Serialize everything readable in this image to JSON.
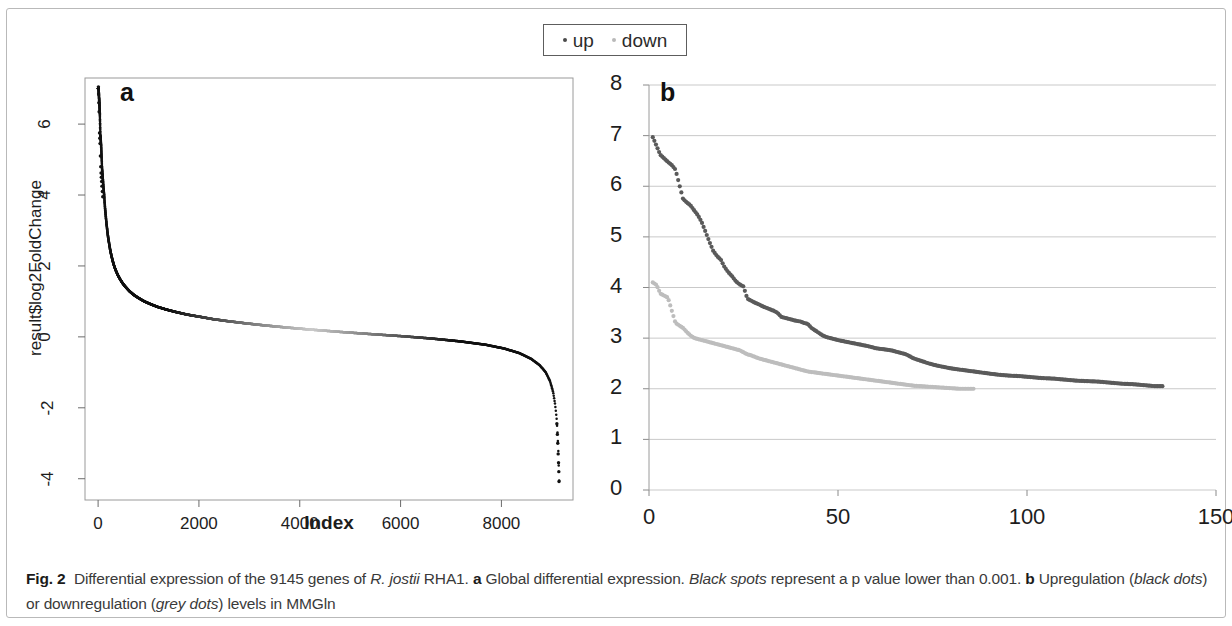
{
  "figure": {
    "frame_color": "#b9b9b9",
    "background": "#ffffff"
  },
  "legend": {
    "entries": [
      {
        "label": "up",
        "color": "#4a4a4a",
        "marker": "dot-marker"
      },
      {
        "label": "down",
        "color": "#b9b9b9",
        "marker": "dot-marker"
      }
    ]
  },
  "caption": {
    "fig_label": "Fig. 2",
    "text_1": "Differential expression of the 9145 genes of ",
    "italic_1": "R. jostii",
    "text_2": " RHA1. ",
    "bold_a": "a",
    "text_3": " Global differential expression. ",
    "italic_2": "Black spots",
    "text_4": " represent a p value lower than 0.001. ",
    "bold_b": "b",
    "text_5": " Upregulation (",
    "italic_3": "black dots",
    "text_6": ") or downregulation (",
    "italic_4": "grey dots",
    "text_7": ") levels in MMGln"
  },
  "chart_data": [
    {
      "id": "panel-a",
      "type": "scatter",
      "panel_letter": "a",
      "title": "Global differential expression",
      "xlabel": "Index",
      "ylabel": "result$log2FoldChange",
      "xlim": [
        -260,
        9420
      ],
      "ylim": [
        -4.6,
        7.3
      ],
      "xticks": [
        0,
        2000,
        4000,
        6000,
        8000
      ],
      "yticks": [
        -4,
        -2,
        0,
        2,
        4,
        6
      ],
      "grid": false,
      "frame": true,
      "n_genes": 9145,
      "significant_color": "#111111",
      "nonsignificant_color": "#b0b0b0",
      "description": "Sorted log2 fold change of all 9145 genes; significant (p < 0.001) points black, non-significant grey",
      "points": [
        [
          10,
          7.0
        ],
        [
          18,
          6.75
        ],
        [
          26,
          6.55
        ],
        [
          34,
          6.3
        ],
        [
          44,
          5.7
        ],
        [
          52,
          5.55
        ],
        [
          60,
          5.4
        ],
        [
          70,
          5.05
        ],
        [
          78,
          4.75
        ],
        [
          86,
          4.6
        ],
        [
          94,
          4.45
        ],
        [
          102,
          4.3
        ],
        [
          110,
          4.15
        ],
        [
          120,
          4.0
        ],
        [
          128,
          3.82
        ],
        [
          136,
          3.66
        ],
        [
          146,
          3.5
        ],
        [
          156,
          3.34
        ],
        [
          166,
          3.2
        ],
        [
          178,
          3.05
        ],
        [
          190,
          2.9
        ],
        [
          205,
          2.75
        ],
        [
          222,
          2.6
        ],
        [
          240,
          2.45
        ],
        [
          262,
          2.3
        ],
        [
          288,
          2.15
        ],
        [
          318,
          2.0
        ],
        [
          352,
          1.87
        ],
        [
          392,
          1.74
        ],
        [
          438,
          1.62
        ],
        [
          492,
          1.5
        ],
        [
          556,
          1.39
        ],
        [
          628,
          1.28
        ],
        [
          712,
          1.18
        ],
        [
          808,
          1.09
        ],
        [
          918,
          1.0
        ],
        [
          1045,
          0.92
        ],
        [
          1190,
          0.84
        ],
        [
          1355,
          0.77
        ],
        [
          1545,
          0.7
        ],
        [
          1760,
          0.63
        ],
        [
          2005,
          0.57
        ],
        [
          2280,
          0.5
        ],
        [
          2590,
          0.44
        ],
        [
          2940,
          0.38
        ],
        [
          3330,
          0.32
        ],
        [
          3770,
          0.26
        ],
        [
          4260,
          0.2
        ],
        [
          4800,
          0.14
        ],
        [
          5390,
          0.08
        ],
        [
          6020,
          0.02
        ],
        [
          6640,
          -0.05
        ],
        [
          7200,
          -0.13
        ],
        [
          7680,
          -0.22
        ],
        [
          8060,
          -0.33
        ],
        [
          8360,
          -0.46
        ],
        [
          8590,
          -0.62
        ],
        [
          8760,
          -0.8
        ],
        [
          8880,
          -1.0
        ],
        [
          8965,
          -1.25
        ],
        [
          9025,
          -1.55
        ],
        [
          9065,
          -1.9
        ],
        [
          9095,
          -2.3
        ],
        [
          9112,
          -2.7
        ],
        [
          9124,
          -3.05
        ],
        [
          9132,
          -3.35
        ],
        [
          9138,
          -3.7
        ],
        [
          9143,
          -4.05
        ]
      ],
      "grey_index_start": 1400,
      "grey_index_end": 7100
    },
    {
      "id": "panel-b",
      "type": "scatter",
      "panel_letter": "b",
      "title": "Upregulation or downregulation levels in MMGln",
      "xlabel": "",
      "ylabel": "",
      "xlim": [
        0,
        150
      ],
      "ylim": [
        0,
        8
      ],
      "xticks": [
        0,
        50,
        100,
        150
      ],
      "yticks": [
        0,
        1,
        2,
        3,
        4,
        5,
        6,
        7,
        8
      ],
      "grid": true,
      "grid_color": "#c9c9c9",
      "series": [
        {
          "name": "up",
          "color": "#5a5a5a",
          "points": [
            [
              1,
              6.97
            ],
            [
              3,
              6.62
            ],
            [
              4,
              6.55
            ],
            [
              5,
              6.48
            ],
            [
              6,
              6.42
            ],
            [
              7,
              6.33
            ],
            [
              9,
              5.75
            ],
            [
              10,
              5.68
            ],
            [
              11,
              5.62
            ],
            [
              12,
              5.52
            ],
            [
              13,
              5.42
            ],
            [
              14,
              5.28
            ],
            [
              16,
              4.9
            ],
            [
              17,
              4.72
            ],
            [
              18,
              4.62
            ],
            [
              19,
              4.55
            ],
            [
              20,
              4.4
            ],
            [
              21,
              4.3
            ],
            [
              22,
              4.22
            ],
            [
              23,
              4.12
            ],
            [
              24,
              4.06
            ],
            [
              25,
              4.02
            ],
            [
              26,
              3.78
            ],
            [
              27,
              3.74
            ],
            [
              28,
              3.7
            ],
            [
              29,
              3.67
            ],
            [
              30,
              3.63
            ],
            [
              31,
              3.6
            ],
            [
              32,
              3.57
            ],
            [
              33,
              3.54
            ],
            [
              34,
              3.5
            ],
            [
              35,
              3.42
            ],
            [
              36,
              3.4
            ],
            [
              37,
              3.38
            ],
            [
              38,
              3.36
            ],
            [
              39,
              3.34
            ],
            [
              40,
              3.33
            ],
            [
              41,
              3.3
            ],
            [
              42,
              3.28
            ],
            [
              43,
              3.2
            ],
            [
              44,
              3.15
            ],
            [
              45,
              3.1
            ],
            [
              46,
              3.05
            ],
            [
              47,
              3.02
            ],
            [
              48,
              3.0
            ],
            [
              49,
              2.98
            ],
            [
              50,
              2.96
            ],
            [
              52,
              2.93
            ],
            [
              54,
              2.9
            ],
            [
              56,
              2.87
            ],
            [
              58,
              2.84
            ],
            [
              60,
              2.8
            ],
            [
              62,
              2.78
            ],
            [
              64,
              2.76
            ],
            [
              66,
              2.72
            ],
            [
              68,
              2.68
            ],
            [
              70,
              2.6
            ],
            [
              72,
              2.55
            ],
            [
              74,
              2.5
            ],
            [
              76,
              2.46
            ],
            [
              78,
              2.43
            ],
            [
              80,
              2.4
            ],
            [
              82,
              2.38
            ],
            [
              84,
              2.36
            ],
            [
              86,
              2.34
            ],
            [
              88,
              2.32
            ],
            [
              90,
              2.3
            ],
            [
              92,
              2.28
            ],
            [
              95,
              2.26
            ],
            [
              98,
              2.25
            ],
            [
              101,
              2.23
            ],
            [
              104,
              2.21
            ],
            [
              107,
              2.2
            ],
            [
              110,
              2.18
            ],
            [
              113,
              2.16
            ],
            [
              116,
              2.15
            ],
            [
              119,
              2.14
            ],
            [
              122,
              2.12
            ],
            [
              125,
              2.1
            ],
            [
              128,
              2.09
            ],
            [
              131,
              2.07
            ],
            [
              134,
              2.05
            ],
            [
              136,
              2.05
            ]
          ]
        },
        {
          "name": "down",
          "color": "#bdbdbd",
          "points": [
            [
              1,
              4.1
            ],
            [
              2,
              4.05
            ],
            [
              3,
              3.88
            ],
            [
              4,
              3.84
            ],
            [
              5,
              3.8
            ],
            [
              7,
              3.3
            ],
            [
              8,
              3.25
            ],
            [
              9,
              3.2
            ],
            [
              10,
              3.12
            ],
            [
              11,
              3.05
            ],
            [
              12,
              3.0
            ],
            [
              13,
              2.98
            ],
            [
              14,
              2.96
            ],
            [
              15,
              2.94
            ],
            [
              16,
              2.92
            ],
            [
              17,
              2.9
            ],
            [
              18,
              2.88
            ],
            [
              19,
              2.86
            ],
            [
              20,
              2.84
            ],
            [
              21,
              2.82
            ],
            [
              22,
              2.8
            ],
            [
              23,
              2.78
            ],
            [
              24,
              2.76
            ],
            [
              25,
              2.72
            ],
            [
              26,
              2.68
            ],
            [
              27,
              2.66
            ],
            [
              28,
              2.63
            ],
            [
              29,
              2.6
            ],
            [
              30,
              2.58
            ],
            [
              31,
              2.56
            ],
            [
              32,
              2.54
            ],
            [
              33,
              2.52
            ],
            [
              34,
              2.5
            ],
            [
              35,
              2.48
            ],
            [
              36,
              2.46
            ],
            [
              37,
              2.44
            ],
            [
              38,
              2.42
            ],
            [
              39,
              2.4
            ],
            [
              40,
              2.38
            ],
            [
              41,
              2.36
            ],
            [
              42,
              2.34
            ],
            [
              44,
              2.32
            ],
            [
              46,
              2.3
            ],
            [
              48,
              2.28
            ],
            [
              50,
              2.26
            ],
            [
              52,
              2.24
            ],
            [
              54,
              2.22
            ],
            [
              56,
              2.2
            ],
            [
              58,
              2.18
            ],
            [
              60,
              2.16
            ],
            [
              62,
              2.14
            ],
            [
              64,
              2.12
            ],
            [
              66,
              2.1
            ],
            [
              68,
              2.08
            ],
            [
              70,
              2.06
            ],
            [
              72,
              2.05
            ],
            [
              74,
              2.04
            ],
            [
              76,
              2.03
            ],
            [
              78,
              2.02
            ],
            [
              80,
              2.01
            ],
            [
              82,
              2.0
            ],
            [
              84,
              2.0
            ],
            [
              86,
              2.0
            ]
          ]
        }
      ]
    }
  ]
}
